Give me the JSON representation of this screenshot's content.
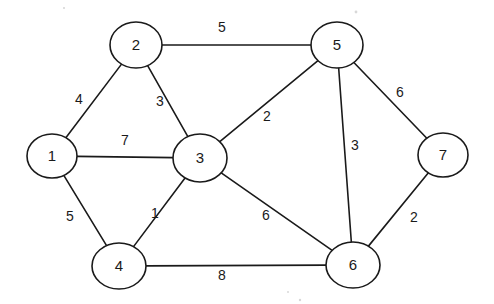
{
  "diagram": {
    "type": "node-link-graph",
    "background_color": "#ffffff",
    "stroke_color": "#1a1a1a",
    "node_fill_color": "#ffffff"
  },
  "nodes": [
    {
      "id": "1",
      "label": "1",
      "cx": 52,
      "cy": 156,
      "rx": 25,
      "ry": 22
    },
    {
      "id": "2",
      "label": "2",
      "cx": 136,
      "cy": 45,
      "rx": 26,
      "ry": 23
    },
    {
      "id": "3",
      "label": "3",
      "cx": 200,
      "cy": 158,
      "rx": 27,
      "ry": 24
    },
    {
      "id": "4",
      "label": "4",
      "cx": 119,
      "cy": 266,
      "rx": 27,
      "ry": 23
    },
    {
      "id": "5",
      "label": "5",
      "cx": 337,
      "cy": 45,
      "rx": 26,
      "ry": 23
    },
    {
      "id": "6",
      "label": "6",
      "cx": 353,
      "cy": 265,
      "rx": 27,
      "ry": 23
    },
    {
      "id": "7",
      "label": "7",
      "cx": 443,
      "cy": 155,
      "rx": 25,
      "ry": 22
    }
  ],
  "edges": [
    {
      "id": "e-2-5",
      "source": "2",
      "target": "5",
      "weight": "5",
      "label_x": 222,
      "label_y": 28
    },
    {
      "id": "e-1-2",
      "source": "1",
      "target": "2",
      "weight": "4",
      "label_x": 79,
      "label_y": 100
    },
    {
      "id": "e-2-3",
      "source": "2",
      "target": "3",
      "weight": "3",
      "label_x": 160,
      "label_y": 102
    },
    {
      "id": "e-3-5",
      "source": "3",
      "target": "5",
      "weight": "2",
      "label_x": 267,
      "label_y": 117
    },
    {
      "id": "e-1-3",
      "source": "1",
      "target": "3",
      "weight": "7",
      "label_x": 125,
      "label_y": 141
    },
    {
      "id": "e-5-7",
      "source": "5",
      "target": "7",
      "weight": "6",
      "label_x": 400,
      "label_y": 93
    },
    {
      "id": "e-5-6",
      "source": "5",
      "target": "6",
      "weight": "3",
      "label_x": 355,
      "label_y": 146
    },
    {
      "id": "e-1-4",
      "source": "1",
      "target": "4",
      "weight": "5",
      "label_x": 70,
      "label_y": 217
    },
    {
      "id": "e-3-4",
      "source": "3",
      "target": "4",
      "weight": "1",
      "label_x": 155,
      "label_y": 214
    },
    {
      "id": "e-3-6",
      "source": "3",
      "target": "6",
      "weight": "6",
      "label_x": 266,
      "label_y": 216
    },
    {
      "id": "e-6-7",
      "source": "6",
      "target": "7",
      "weight": "2",
      "label_x": 414,
      "label_y": 218
    },
    {
      "id": "e-4-6",
      "source": "4",
      "target": "6",
      "weight": "8",
      "label_x": 222,
      "label_y": 276
    }
  ],
  "chart_data": {
    "type": "table",
    "vertices": [
      "1",
      "2",
      "3",
      "4",
      "5",
      "6",
      "7"
    ],
    "edge_list": [
      [
        "1",
        "2",
        4
      ],
      [
        "1",
        "3",
        7
      ],
      [
        "1",
        "4",
        5
      ],
      [
        "2",
        "3",
        3
      ],
      [
        "2",
        "5",
        5
      ],
      [
        "3",
        "4",
        1
      ],
      [
        "3",
        "5",
        2
      ],
      [
        "3",
        "6",
        6
      ],
      [
        "4",
        "6",
        8
      ],
      [
        "5",
        "6",
        3
      ],
      [
        "5",
        "7",
        6
      ],
      [
        "6",
        "7",
        2
      ]
    ],
    "xlabel": "",
    "ylabel": ""
  }
}
